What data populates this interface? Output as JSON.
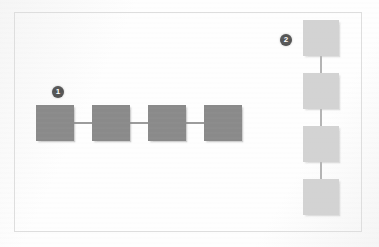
{
  "figure": {
    "type": "block-diagram",
    "background_color": "#fefefe",
    "frame_color": "#dedede"
  },
  "chains": [
    {
      "id": "chain-1",
      "orientation": "horizontal",
      "badge_label": "1",
      "badge_color": "#555555",
      "node_color": "#8a8a8a",
      "node_count": 4,
      "nodes": [
        {
          "label": "",
          "x": 36,
          "y": 105,
          "w": 38,
          "h": 36
        },
        {
          "label": "",
          "x": 92,
          "y": 105,
          "w": 38,
          "h": 36
        },
        {
          "label": "",
          "x": 148,
          "y": 105,
          "w": 38,
          "h": 36
        },
        {
          "label": "",
          "x": 204,
          "y": 105,
          "w": 38,
          "h": 36
        }
      ],
      "connectors": [
        {
          "x": 74,
          "y": 122,
          "length": 18
        },
        {
          "x": 130,
          "y": 122,
          "length": 18
        },
        {
          "x": 186,
          "y": 122,
          "length": 18
        }
      ],
      "badge": {
        "x": 52,
        "y": 86
      }
    },
    {
      "id": "chain-2",
      "orientation": "vertical",
      "badge_label": "2",
      "badge_color": "#555555",
      "node_color": "#d3d3d3",
      "node_count": 4,
      "nodes": [
        {
          "label": "",
          "x": 303,
          "y": 20,
          "w": 36,
          "h": 36
        },
        {
          "label": "",
          "x": 303,
          "y": 73,
          "w": 36,
          "h": 36
        },
        {
          "label": "",
          "x": 303,
          "y": 126,
          "w": 36,
          "h": 36
        },
        {
          "label": "",
          "x": 303,
          "y": 179,
          "w": 36,
          "h": 36
        }
      ],
      "connectors": [
        {
          "x": 320,
          "y": 56,
          "length": 17
        },
        {
          "x": 320,
          "y": 109,
          "length": 17
        },
        {
          "x": 320,
          "y": 162,
          "length": 17
        }
      ],
      "badge": {
        "x": 280,
        "y": 34
      }
    }
  ]
}
